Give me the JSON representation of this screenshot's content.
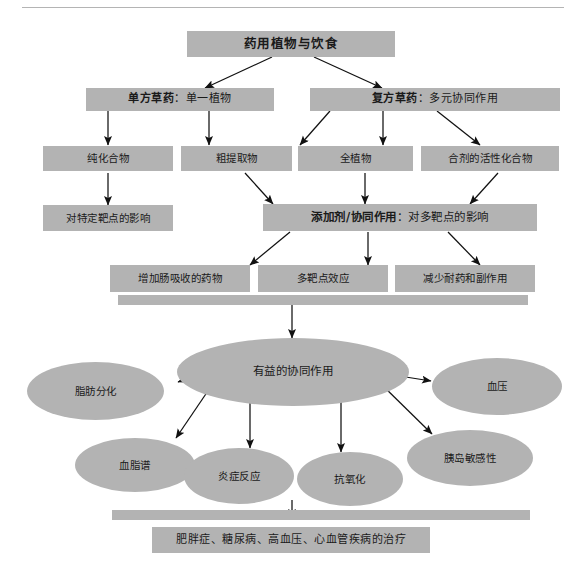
{
  "diagram": {
    "title_rule": "",
    "theme": {
      "node_fill": "#b3b3b3",
      "text_color": "#1a1a1a",
      "edge_color": "#111111",
      "rule_color": "#b4b4b4",
      "background": "#ffffff"
    },
    "nodes": {
      "root": "药用植物与饮食",
      "single_herb_bold": "单方草药",
      "single_herb_rest": "：单一植物",
      "compound_herb_bold": "复方草药",
      "compound_herb_rest": "：多元协同作用",
      "purified_compound": "纯化合物",
      "crude_extract": "粗提取物",
      "whole_plant": "全植物",
      "mixture_active_compound": "合剂的活性化合物",
      "specific_target_effect": "对特定靶点的影响",
      "additive_synergy_bold": "添加剂/协同作用",
      "additive_synergy_rest": "：对多靶点的影响",
      "enhance_absorption": "增加肠吸收的药物",
      "multi_target_effect": "多靶点效应",
      "reduce_resistance": "减少耐药和副作用",
      "beneficial_synergy": "有益的协同作用",
      "fat_differentiation": "脂肪分化",
      "blood_pressure": "血压",
      "lipid_profile": "血脂谱",
      "inflammation": "炎症反应",
      "antioxidant": "抗氧化",
      "insulin_sensitivity": "胰岛敏感性",
      "treatment_outcome": "肥胖症、糖尿病、高血压、心血管疾病的治疗"
    }
  }
}
